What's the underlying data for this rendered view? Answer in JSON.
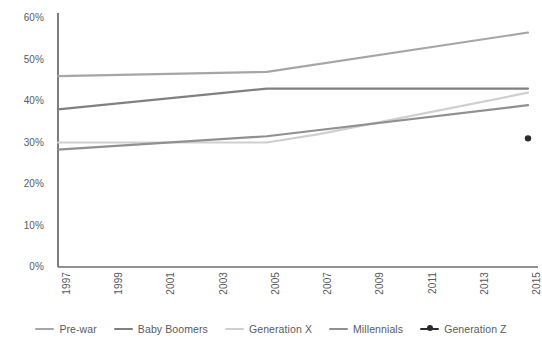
{
  "chart_data": {
    "type": "line",
    "title": "",
    "subtitle": "",
    "xlabel": "",
    "ylabel": "",
    "x": [
      1997,
      1998,
      1999,
      2000,
      2001,
      2002,
      2003,
      2004,
      2005,
      2006,
      2007,
      2008,
      2009,
      2010,
      2011,
      2012,
      2013,
      2014,
      2015
    ],
    "xlim": [
      1997,
      2015
    ],
    "ylim": [
      0,
      60
    ],
    "ytick_values": [
      0,
      10,
      20,
      30,
      40,
      50,
      60
    ],
    "ytick_labels": [
      "0%",
      "10%",
      "20%",
      "30%",
      "40%",
      "50%",
      "60%"
    ],
    "xtick_values": [
      1997,
      1999,
      2001,
      2003,
      2005,
      2007,
      2009,
      2011,
      2013,
      2015
    ],
    "xtick_labels": [
      "1997",
      "1999",
      "2001",
      "2003",
      "2005",
      "2007",
      "2009",
      "2011",
      "2013",
      "2015"
    ],
    "xtick_rotation": -90,
    "grid": false,
    "legend_position": "bottom",
    "axis_color": "#6e6e6e",
    "series": [
      {
        "name": "Pre-war",
        "color": "#a6a6a6",
        "marker": "none",
        "points": [
          {
            "x": 1997,
            "y": 46.0
          },
          {
            "x": 2005,
            "y": 47.0
          },
          {
            "x": 2015,
            "y": 56.5
          }
        ]
      },
      {
        "name": "Baby Boomers",
        "color": "#808080",
        "marker": "none",
        "points": [
          {
            "x": 1997,
            "y": 38.0
          },
          {
            "x": 2005,
            "y": 43.0
          },
          {
            "x": 2015,
            "y": 43.0
          }
        ]
      },
      {
        "name": "Generation X",
        "color": "#cfcfcf",
        "marker": "none",
        "points": [
          {
            "x": 1997,
            "y": 30.0
          },
          {
            "x": 2005,
            "y": 30.0
          },
          {
            "x": 2007,
            "y": 32.0
          },
          {
            "x": 2015,
            "y": 42.0
          }
        ]
      },
      {
        "name": "Millennials",
        "color": "#909090",
        "marker": "none",
        "points": [
          {
            "x": 1997,
            "y": 28.3
          },
          {
            "x": 2005,
            "y": 31.5
          },
          {
            "x": 2015,
            "y": 39.0
          }
        ]
      },
      {
        "name": "Generation Z",
        "color": "#2b2b2b",
        "marker": "dot",
        "points": [
          {
            "x": 2015,
            "y": 31.0
          }
        ]
      }
    ]
  },
  "legend": {
    "items": [
      {
        "label": "Pre-war"
      },
      {
        "label": "Baby Boomers"
      },
      {
        "label": "Generation X"
      },
      {
        "label": "Millennials"
      },
      {
        "label": "Generation Z"
      }
    ]
  }
}
